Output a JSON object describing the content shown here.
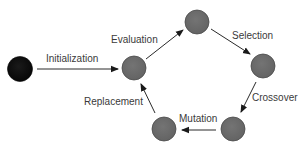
{
  "diagram": {
    "colors": {
      "start_node": "#0d0d0d",
      "cycle_node": "#6a6a6a",
      "node_stroke": "#4a4a4a",
      "edge": "#2a2a2a",
      "label": "#3a3a3a",
      "background": "#ffffff"
    },
    "nodes": [
      {
        "id": "start",
        "cx": 20,
        "cy": 69,
        "r": 12,
        "type": "start"
      },
      {
        "id": "evaluated",
        "cx": 134,
        "cy": 68,
        "r": 12,
        "type": "cycle"
      },
      {
        "id": "population-top",
        "cx": 197,
        "cy": 22,
        "r": 12,
        "type": "cycle"
      },
      {
        "id": "selected",
        "cx": 263,
        "cy": 66,
        "r": 12,
        "type": "cycle"
      },
      {
        "id": "crossed",
        "cx": 233,
        "cy": 128,
        "r": 12,
        "type": "cycle"
      },
      {
        "id": "mutated",
        "cx": 164,
        "cy": 128,
        "r": 12,
        "type": "cycle"
      }
    ],
    "edges": [
      {
        "from": "start",
        "to": "evaluated",
        "label": "Initialization"
      },
      {
        "from": "evaluated",
        "to": "population-top",
        "label": "Evaluation"
      },
      {
        "from": "population-top",
        "to": "selected",
        "label": "Selection"
      },
      {
        "from": "selected",
        "to": "crossed",
        "label": "Crossover"
      },
      {
        "from": "crossed",
        "to": "mutated",
        "label": "Mutation"
      },
      {
        "from": "mutated",
        "to": "evaluated",
        "label": "Replacement"
      }
    ],
    "labels": {
      "initialization": "Initialization",
      "evaluation": "Evaluation",
      "selection": "Selection",
      "crossover": "Crossover",
      "mutation": "Mutation",
      "replacement": "Replacement"
    }
  }
}
